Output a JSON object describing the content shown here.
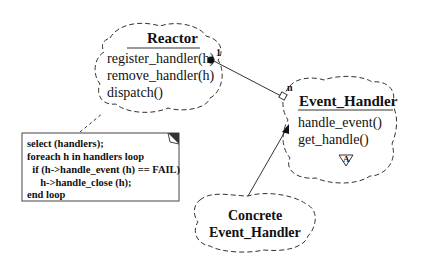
{
  "reactor": {
    "title": "Reactor",
    "methods": [
      "register_handler(h)",
      "remove_handler(h)",
      "dispatch()"
    ],
    "multiplicity": "1"
  },
  "event_handler": {
    "title": "Event_Handler",
    "methods": [
      "handle_event()",
      "get_handle()"
    ],
    "multiplicity": "n",
    "abstract_badge": "A"
  },
  "concrete": {
    "line1": "Concrete",
    "line2": "Event_Handler"
  },
  "note": {
    "lines": [
      "select (handlers);",
      "foreach h in handlers loop",
      "  if (h->handle_event (h) == FAIL)",
      "     h->handle_close (h);",
      "end loop"
    ]
  }
}
